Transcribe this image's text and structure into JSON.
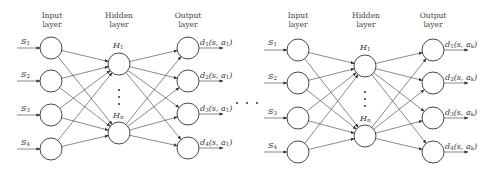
{
  "diagram": {
    "type": "neural-network-sequence",
    "networks": [
      {
        "id": "network-1",
        "layers": {
          "input_label": [
            "Input",
            "layer"
          ],
          "hidden_label": [
            "Hidden",
            "layer"
          ],
          "output_label": [
            "Output",
            "layer"
          ]
        },
        "inputs": [
          {
            "name": "S",
            "sub": "1"
          },
          {
            "name": "S",
            "sub": "2"
          },
          {
            "name": "S",
            "sub": "3"
          },
          {
            "name": "S",
            "sub": "4"
          }
        ],
        "hidden": [
          {
            "name": "H",
            "sub": "1"
          },
          {
            "name": "H",
            "sub": "n"
          }
        ],
        "hidden_ellipsis": "⋮",
        "outputs": [
          {
            "name": "d",
            "sub": "1",
            "args": "(s, a",
            "asub": "1",
            "close": ")"
          },
          {
            "name": "d",
            "sub": "2",
            "args": "(s, a",
            "asub": "1",
            "close": ")"
          },
          {
            "name": "d",
            "sub": "3",
            "args": "(s, a",
            "asub": "1",
            "close": ")"
          },
          {
            "name": "d",
            "sub": "4",
            "args": "(s, a",
            "asub": "1",
            "close": ")"
          }
        ]
      },
      {
        "id": "network-k",
        "layers": {
          "input_label": [
            "Input",
            "layer"
          ],
          "hidden_label": [
            "Hidden",
            "layer"
          ],
          "output_label": [
            "Output",
            "layer"
          ]
        },
        "inputs": [
          {
            "name": "S",
            "sub": "1"
          },
          {
            "name": "S",
            "sub": "2"
          },
          {
            "name": "S",
            "sub": "3"
          },
          {
            "name": "S",
            "sub": "4"
          }
        ],
        "hidden": [
          {
            "name": "H",
            "sub": "1"
          },
          {
            "name": "H",
            "sub": "n"
          }
        ],
        "hidden_ellipsis": "⋮",
        "outputs": [
          {
            "name": "d",
            "sub": "1",
            "args": "(s, a",
            "asub": "k",
            "close": ")"
          },
          {
            "name": "d",
            "sub": "2",
            "args": "(s, a",
            "asub": "k",
            "close": ")"
          },
          {
            "name": "d",
            "sub": "3",
            "args": "(s, a",
            "asub": "k",
            "close": ")"
          },
          {
            "name": "d",
            "sub": "4",
            "args": "(s, a",
            "asub": "k",
            "close": ")"
          }
        ]
      }
    ],
    "between_networks_ellipsis": "• • •",
    "colors": {
      "stroke": "#333333",
      "background": "#ffffff",
      "text": "#333333"
    }
  }
}
